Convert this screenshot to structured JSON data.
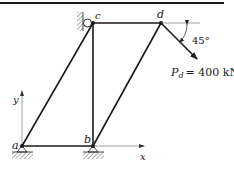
{
  "diagram": {
    "type": "truss",
    "nodes": {
      "a": {
        "label": "a",
        "x": 22,
        "y": 146
      },
      "b": {
        "label": "b",
        "x": 93,
        "y": 146
      },
      "c": {
        "label": "c",
        "x": 93,
        "y": 23
      },
      "d": {
        "label": "d",
        "x": 161,
        "y": 23
      }
    },
    "members": [
      [
        "a",
        "b"
      ],
      [
        "a",
        "c"
      ],
      [
        "b",
        "c"
      ],
      [
        "b",
        "d"
      ],
      [
        "c",
        "d"
      ]
    ],
    "supports": {
      "a": "pin",
      "b": "pin",
      "c": "roller-on-wall"
    },
    "axes": {
      "x_label": "x",
      "y_label": "y"
    },
    "load": {
      "name_main": "P",
      "name_sub": "d",
      "equals": "= 400 kN",
      "full_text": "P_d = 400 kN",
      "magnitude": 400,
      "unit": "kN",
      "angle_label": "45°",
      "angle_deg": 45,
      "direction": "down-right below horizontal"
    },
    "colors": {
      "line": "#1a1a1a",
      "axis": "#7a7a7a",
      "hatch": "#555555"
    }
  }
}
